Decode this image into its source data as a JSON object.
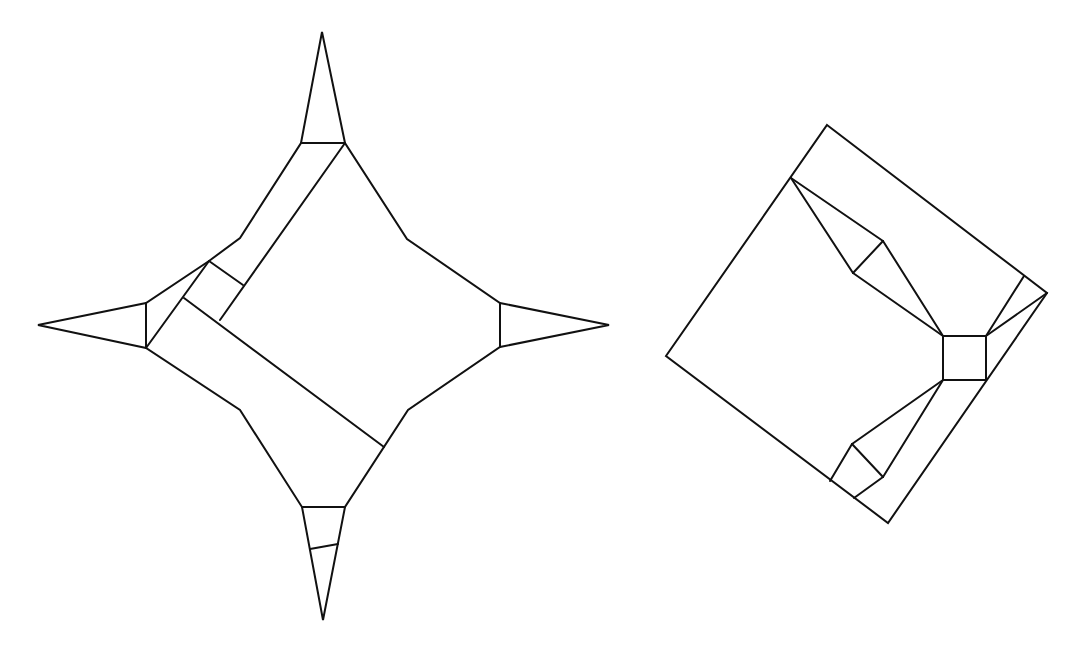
{
  "diagram": {
    "title": "",
    "stroke_color": "#111111",
    "background": "#ffffff",
    "figures": [
      {
        "name": "four-point-star-fold",
        "outline": [
          [
            322,
            32
          ],
          [
            345,
            143
          ],
          [
            407,
            239
          ],
          [
            500,
            303
          ],
          [
            609,
            325
          ],
          [
            500,
            347
          ],
          [
            408,
            410
          ],
          [
            345,
            507
          ],
          [
            323,
            620
          ],
          [
            302,
            507
          ],
          [
            240,
            410
          ],
          [
            146,
            348
          ],
          [
            38,
            325
          ],
          [
            146,
            303
          ],
          [
            209,
            261
          ],
          [
            240,
            238
          ],
          [
            301,
            143
          ]
        ],
        "creases": [
          [
            [
              301,
              143
            ],
            [
              345,
              143
            ]
          ],
          [
            [
              146,
              303
            ],
            [
              146,
              348
            ]
          ],
          [
            [
              500,
              303
            ],
            [
              500,
              347
            ]
          ],
          [
            [
              302,
              507
            ],
            [
              345,
              507
            ]
          ],
          [
            [
              310,
              549
            ],
            [
              338,
              544
            ]
          ],
          [
            [
              345,
              143
            ],
            [
              220,
              320
            ]
          ],
          [
            [
              209,
              261
            ],
            [
              146,
              348
            ]
          ],
          [
            [
              209,
              261
            ],
            [
              243,
              285
            ]
          ],
          [
            [
              184,
              298
            ],
            [
              384,
              447
            ]
          ]
        ]
      },
      {
        "name": "rotated-square-fold",
        "outline": [
          [
            827,
            125
          ],
          [
            1047,
            293
          ],
          [
            888,
            523
          ],
          [
            666,
            356
          ]
        ],
        "creases": [
          [
            [
              791,
              178
            ],
            [
              883,
              241
            ]
          ],
          [
            [
              791,
              178
            ],
            [
              853,
              273
            ]
          ],
          [
            [
              883,
              241
            ],
            [
              853,
              273
            ]
          ],
          [
            [
              883,
              241
            ],
            [
              943,
              336
            ]
          ],
          [
            [
              853,
              273
            ],
            [
              943,
              336
            ]
          ],
          [
            [
              943,
              336
            ],
            [
              986,
              336
            ]
          ],
          [
            [
              986,
              336
            ],
            [
              986,
              380
            ]
          ],
          [
            [
              986,
              380
            ],
            [
              943,
              380
            ]
          ],
          [
            [
              943,
              380
            ],
            [
              943,
              336
            ]
          ],
          [
            [
              986,
              336
            ],
            [
              1024,
              276
            ]
          ],
          [
            [
              986,
              336
            ],
            [
              1047,
              293
            ]
          ],
          [
            [
              943,
              380
            ],
            [
              852,
              444
            ]
          ],
          [
            [
              943,
              380
            ],
            [
              883,
              477
            ]
          ],
          [
            [
              852,
              444
            ],
            [
              883,
              477
            ]
          ],
          [
            [
              852,
              444
            ],
            [
              830,
              481
            ]
          ],
          [
            [
              883,
              477
            ],
            [
              854,
              498
            ]
          ]
        ]
      }
    ]
  }
}
